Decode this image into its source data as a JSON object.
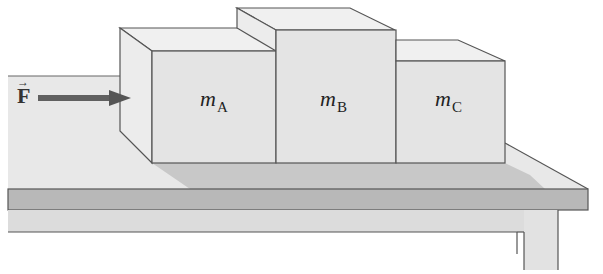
{
  "diagram": {
    "type": "physics-free-body-setup",
    "force": {
      "symbol": "F",
      "vector_mark": "→",
      "direction": "right"
    },
    "blocks": [
      {
        "id": "A",
        "mass_symbol": "m",
        "subscript": "A"
      },
      {
        "id": "B",
        "mass_symbol": "m",
        "subscript": "B"
      },
      {
        "id": "C",
        "mass_symbol": "m",
        "subscript": "C"
      }
    ],
    "surface": "table",
    "colors": {
      "block_front": "#e4e4e4",
      "block_side": "#ececec",
      "block_top": "#f0f0f0",
      "table_top": "#e6e6e6",
      "shadow": "#c4c4c4",
      "table_edge": "#b4b4b4",
      "table_under": "#dadada",
      "outline": "#555555",
      "arrow": "#555555"
    }
  }
}
